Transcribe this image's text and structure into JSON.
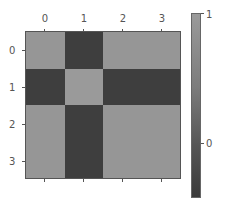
{
  "chart_data": {
    "type": "heatmap",
    "title": "",
    "xlabel": "",
    "ylabel": "",
    "x_tick_labels": [
      "0",
      "1",
      "2",
      "3"
    ],
    "y_tick_labels": [
      "0",
      "1",
      "2",
      "3"
    ],
    "x_ticks_position": "top",
    "values": [
      [
        1.0,
        -0.4,
        1.0,
        1.0
      ],
      [
        -0.4,
        1.0,
        -0.4,
        -0.4
      ],
      [
        1.0,
        -0.4,
        1.0,
        1.0
      ],
      [
        1.0,
        -0.4,
        1.0,
        1.0
      ]
    ],
    "colormap": "gray",
    "colorbar": {
      "ticks": [
        "1",
        "0"
      ],
      "range": [
        -0.42,
        1.0
      ]
    },
    "cell_colors": [
      [
        "#969696",
        "#3e3e3e",
        "#969696",
        "#969696"
      ],
      [
        "#3e3e3e",
        "#9a9a9a",
        "#3e3e3e",
        "#3e3e3e"
      ],
      [
        "#969696",
        "#3e3e3e",
        "#969696",
        "#969696"
      ],
      [
        "#969696",
        "#3e3e3e",
        "#969696",
        "#969696"
      ]
    ]
  }
}
